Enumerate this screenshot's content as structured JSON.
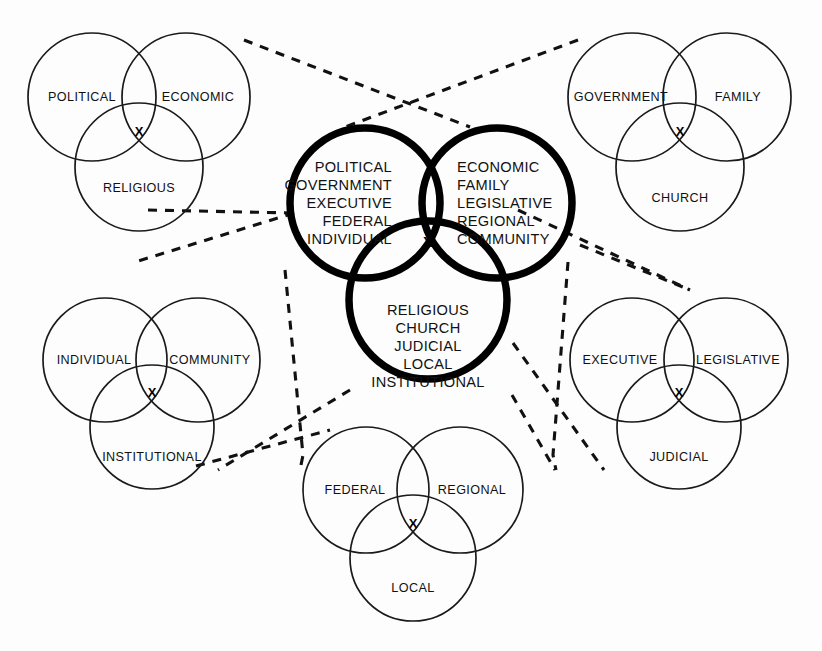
{
  "diagram": {
    "background_color": "#fdfdfd",
    "stroke_color": "#111111",
    "intersection_marker": "X",
    "connector_style": "dashed"
  },
  "central": {
    "name": "central-venn",
    "emphasis": "bold",
    "left_circle": {
      "name": "central-left-circle",
      "align": "right",
      "lines": [
        "POLITICAL",
        "GOVERNMENT",
        "EXECUTIVE",
        "FEDERAL",
        "INDIVIDUAL"
      ]
    },
    "right_circle": {
      "name": "central-right-circle",
      "align": "left",
      "lines": [
        "ECONOMIC",
        "FAMILY",
        "LEGISLATIVE",
        "REGIONAL",
        "COMMUNITY"
      ]
    },
    "bottom_circle": {
      "name": "central-bottom-circle",
      "align": "center",
      "lines": [
        "RELIGIOUS",
        "CHURCH",
        "JUDICIAL",
        "LOCAL",
        "INSTITUTIONAL"
      ]
    },
    "marker": "X"
  },
  "satellites": [
    {
      "id": "top-left",
      "name": "venn-political-economic-religious",
      "left": "POLITICAL",
      "right": "ECONOMIC",
      "bottom": "RELIGIOUS",
      "marker": "X"
    },
    {
      "id": "top-right",
      "name": "venn-government-family-church",
      "left": "GOVERNMENT",
      "right": "FAMILY",
      "bottom": "CHURCH",
      "marker": "X"
    },
    {
      "id": "bottom-left",
      "name": "venn-individual-community-institutional",
      "left": "INDIVIDUAL",
      "right": "COMMUNITY",
      "bottom": "INSTITUTIONAL",
      "marker": "X"
    },
    {
      "id": "bottom-right",
      "name": "venn-executive-legislative-judicial",
      "left": "EXECUTIVE",
      "right": "LEGISLATIVE",
      "bottom": "JUDICIAL",
      "marker": "X"
    },
    {
      "id": "bottom-center",
      "name": "venn-federal-regional-local",
      "left": "FEDERAL",
      "right": "REGIONAL",
      "bottom": "LOCAL",
      "marker": "X"
    }
  ]
}
